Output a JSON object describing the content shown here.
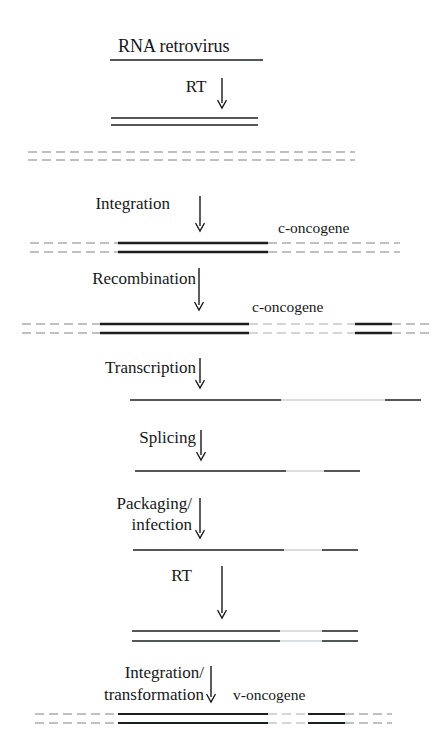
{
  "figure": {
    "title": "RNA retrovirus",
    "background_color": "#ffffff",
    "ink_color": "#1d1e20",
    "faint_color": "#b9bcc0",
    "host_color": "#a9acb1"
  },
  "steps": [
    {
      "id": "rt1",
      "label": "RT",
      "label_x": 196,
      "label_y": 92,
      "arrow_x": 222,
      "arrow_y1": 78,
      "arrow_y2": 108
    },
    {
      "id": "integration",
      "label": "Integration",
      "label_x": 170,
      "label_y": 209,
      "arrow_x": 200,
      "arrow_y1": 196,
      "arrow_y2": 231,
      "anchor": "end"
    },
    {
      "id": "recombination",
      "label": "Recombination",
      "label_x": 196,
      "label_y": 284,
      "arrow_x": 199,
      "arrow_y1": 268,
      "arrow_y2": 310,
      "anchor": "end"
    },
    {
      "id": "transcription",
      "label": "Transcription",
      "label_x": 196,
      "label_y": 373,
      "arrow_x": 200,
      "arrow_y1": 358,
      "arrow_y2": 388,
      "anchor": "end"
    },
    {
      "id": "splicing",
      "label": "Splicing",
      "label_x": 196,
      "label_y": 443,
      "arrow_x": 201,
      "arrow_y1": 430,
      "arrow_y2": 460,
      "anchor": "end"
    },
    {
      "id": "rt2",
      "label": "RT",
      "label_x": 192,
      "label_y": 581,
      "arrow_x": 222,
      "arrow_y1": 566,
      "arrow_y2": 618,
      "anchor": "end"
    }
  ],
  "multiline_steps": [
    {
      "id": "packaging-infection",
      "lines": [
        "Packaging/",
        "infection"
      ],
      "label_x": 192,
      "label_y1": 509,
      "label_y2": 530,
      "arrow_x": 200,
      "arrow_y1": 498,
      "arrow_y2": 538,
      "anchor": "end"
    },
    {
      "id": "integration-transformation",
      "lines": [
        "Integration/",
        "transformation"
      ],
      "label_x": 204,
      "label_y1": 678,
      "label_y2": 700,
      "arrow_x": 211,
      "arrow_y1": 666,
      "arrow_y2": 702,
      "anchor": "end"
    }
  ],
  "gene_labels": [
    {
      "id": "c-oncogene-1",
      "text": "c-oncogene",
      "x": 278,
      "y": 233
    },
    {
      "id": "c-oncogene-2",
      "text": "c-oncogene",
      "x": 252,
      "y": 312
    },
    {
      "id": "v-oncogene",
      "text": "v-oncogene",
      "x": 233,
      "y": 700
    }
  ],
  "title_position": {
    "x": 118,
    "y": 52
  },
  "title_rule": {
    "x1": 110,
    "x2": 263,
    "y": 60,
    "width": 1.6
  },
  "nucleic_rows": [
    {
      "id": "proviral-dna",
      "description": "double-stranded DNA copy after reverse transcription",
      "strands": [
        {
          "y": 118,
          "segments": [
            {
              "x1": 111,
              "x2": 258,
              "tone": "dark",
              "width": 1.7
            }
          ]
        },
        {
          "y": 125,
          "segments": [
            {
              "x1": 111,
              "x2": 258,
              "tone": "dark",
              "width": 1.7
            }
          ]
        }
      ]
    },
    {
      "id": "host-chromosome",
      "description": "host chromosome before integration",
      "strands": [
        {
          "y": 152,
          "segments": [
            {
              "x1": 28,
              "x2": 355,
              "tone": "host",
              "width": 1.3,
              "dash": "9 5"
            }
          ]
        },
        {
          "y": 160,
          "segments": [
            {
              "x1": 28,
              "x2": 355,
              "tone": "host",
              "width": 1.3,
              "dash": "9 5"
            }
          ]
        }
      ]
    },
    {
      "id": "integrated-provirus",
      "description": "provirus integrated into host chromosome adjacent to c-oncogene",
      "strands": [
        {
          "y": 243,
          "segments": [
            {
              "x1": 30,
              "x2": 118,
              "tone": "host",
              "width": 1.3,
              "dash": "9 5"
            },
            {
              "x1": 118,
              "x2": 268,
              "tone": "dark",
              "width": 2.4
            },
            {
              "x1": 268,
              "x2": 400,
              "tone": "host",
              "width": 1.3,
              "dash": "9 5"
            }
          ]
        },
        {
          "y": 252,
          "segments": [
            {
              "x1": 30,
              "x2": 118,
              "tone": "host",
              "width": 1.3,
              "dash": "9 5"
            },
            {
              "x1": 118,
              "x2": 268,
              "tone": "dark",
              "width": 2.4
            },
            {
              "x1": 268,
              "x2": 400,
              "tone": "host",
              "width": 1.3,
              "dash": "9 5"
            }
          ]
        }
      ]
    },
    {
      "id": "recombinant-provirus",
      "description": "recombinant provirus carrying captured c-oncogene sequence",
      "strands": [
        {
          "y": 324,
          "segments": [
            {
              "x1": 22,
              "x2": 100,
              "tone": "host",
              "width": 1.3,
              "dash": "9 5"
            },
            {
              "x1": 100,
              "x2": 249,
              "tone": "dark",
              "width": 2.4
            },
            {
              "x1": 249,
              "x2": 355,
              "tone": "host",
              "width": 1.1,
              "dash": "9 5"
            },
            {
              "x1": 355,
              "x2": 392,
              "tone": "dark",
              "width": 2.4
            },
            {
              "x1": 392,
              "x2": 432,
              "tone": "host",
              "width": 1.3,
              "dash": "9 5"
            }
          ]
        },
        {
          "y": 333,
          "segments": [
            {
              "x1": 22,
              "x2": 100,
              "tone": "host",
              "width": 1.3,
              "dash": "9 5"
            },
            {
              "x1": 100,
              "x2": 249,
              "tone": "dark",
              "width": 2.4
            },
            {
              "x1": 249,
              "x2": 355,
              "tone": "host",
              "width": 1.1,
              "dash": "9 5"
            },
            {
              "x1": 355,
              "x2": 392,
              "tone": "dark",
              "width": 2.4
            },
            {
              "x1": 392,
              "x2": 432,
              "tone": "host",
              "width": 1.3,
              "dash": "9 5"
            }
          ]
        }
      ]
    },
    {
      "id": "primary-transcript",
      "description": "primary RNA transcript",
      "strands": [
        {
          "y": 400,
          "segments": [
            {
              "x1": 130,
              "x2": 281,
              "tone": "dark",
              "width": 1.7
            },
            {
              "x1": 281,
              "x2": 385,
              "tone": "faint",
              "width": 1.1
            },
            {
              "x1": 385,
              "x2": 421,
              "tone": "dark",
              "width": 1.7
            }
          ]
        }
      ]
    },
    {
      "id": "spliced-rna",
      "description": "spliced RNA",
      "strands": [
        {
          "y": 471,
          "segments": [
            {
              "x1": 135,
              "x2": 286,
              "tone": "dark",
              "width": 1.7
            },
            {
              "x1": 286,
              "x2": 324,
              "tone": "faint",
              "width": 1.1
            },
            {
              "x1": 324,
              "x2": 360,
              "tone": "dark",
              "width": 1.7
            }
          ]
        }
      ]
    },
    {
      "id": "packaged-rna",
      "description": "packaged virion RNA delivered by infection",
      "strands": [
        {
          "y": 550,
          "segments": [
            {
              "x1": 133,
              "x2": 284,
              "tone": "dark",
              "width": 1.7
            },
            {
              "x1": 284,
              "x2": 322,
              "tone": "faint",
              "width": 1.1
            },
            {
              "x1": 322,
              "x2": 358,
              "tone": "dark",
              "width": 1.7
            }
          ]
        }
      ]
    },
    {
      "id": "transducing-dna",
      "description": "double-stranded DNA of transducing virus after reverse transcription",
      "strands": [
        {
          "y": 631,
          "segments": [
            {
              "x1": 132,
              "x2": 280,
              "tone": "dark",
              "width": 1.7
            },
            {
              "x1": 280,
              "x2": 322,
              "tone": "faint",
              "width": 1.1
            },
            {
              "x1": 322,
              "x2": 358,
              "tone": "dark",
              "width": 1.7
            }
          ]
        },
        {
          "y": 641,
          "segments": [
            {
              "x1": 132,
              "x2": 280,
              "tone": "dark",
              "width": 1.7
            },
            {
              "x1": 280,
              "x2": 322,
              "tone": "faint",
              "width": 1.1
            },
            {
              "x1": 322,
              "x2": 358,
              "tone": "dark",
              "width": 1.7
            }
          ]
        }
      ]
    },
    {
      "id": "integrated-v-onc",
      "description": "transducing provirus with v-oncogene integrated into new host chromosome",
      "strands": [
        {
          "y": 714,
          "segments": [
            {
              "x1": 35,
              "x2": 118,
              "tone": "host",
              "width": 1.3,
              "dash": "9 5"
            },
            {
              "x1": 118,
              "x2": 268,
              "tone": "dark",
              "width": 2.2
            },
            {
              "x1": 268,
              "x2": 308,
              "tone": "host",
              "width": 1.1,
              "dash": "9 5"
            },
            {
              "x1": 308,
              "x2": 345,
              "tone": "dark",
              "width": 2.2
            },
            {
              "x1": 345,
              "x2": 392,
              "tone": "host",
              "width": 1.3,
              "dash": "9 5"
            }
          ]
        },
        {
          "y": 723,
          "segments": [
            {
              "x1": 35,
              "x2": 118,
              "tone": "host",
              "width": 1.3,
              "dash": "9 5"
            },
            {
              "x1": 118,
              "x2": 268,
              "tone": "dark",
              "width": 2.2
            },
            {
              "x1": 268,
              "x2": 308,
              "tone": "host",
              "width": 1.1,
              "dash": "9 5"
            },
            {
              "x1": 308,
              "x2": 345,
              "tone": "dark",
              "width": 2.2
            },
            {
              "x1": 345,
              "x2": 392,
              "tone": "host",
              "width": 1.3,
              "dash": "9 5"
            }
          ]
        }
      ]
    }
  ]
}
